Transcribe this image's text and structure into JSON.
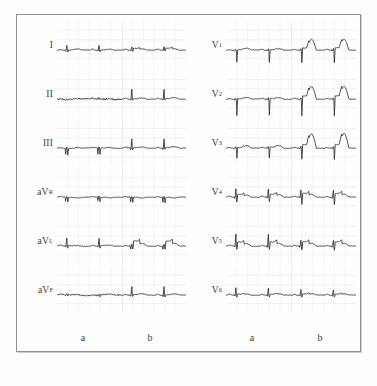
{
  "figure": {
    "kind": "ecg-12-lead-comparison",
    "top_remnant_text": "· · · · · ·",
    "border_color": "#8e8e93",
    "trace_color": "#2f2f33",
    "grid_color": "#e3dcd8",
    "background_color": "#fefefe"
  },
  "columns": [
    {
      "key": "left-a",
      "label": "a"
    },
    {
      "key": "left-b",
      "label": "b"
    },
    {
      "key": "right-a",
      "label": "a"
    },
    {
      "key": "right-b",
      "label": "b"
    }
  ],
  "left_leads": [
    {
      "name": "I",
      "base": "I",
      "sub": ""
    },
    {
      "name": "II",
      "base": "II",
      "sub": ""
    },
    {
      "name": "III",
      "base": "III",
      "sub": ""
    },
    {
      "name": "aVR",
      "base": "aV",
      "sub": "R"
    },
    {
      "name": "aVL",
      "base": "aV",
      "sub": "L"
    },
    {
      "name": "aVF",
      "base": "aV",
      "sub": "F"
    }
  ],
  "right_leads": [
    {
      "name": "V1",
      "base": "V",
      "sub": "1"
    },
    {
      "name": "V2",
      "base": "V",
      "sub": "2"
    },
    {
      "name": "V3",
      "base": "V",
      "sub": "3"
    },
    {
      "name": "V4",
      "base": "V",
      "sub": "4"
    },
    {
      "name": "V5",
      "base": "V",
      "sub": "5"
    },
    {
      "name": "V6",
      "base": "V",
      "sub": "6"
    }
  ],
  "chart_data": {
    "type": "line",
    "title": "",
    "xlabel": "",
    "ylabel": "",
    "beats_per_cell": 2,
    "baseline_mm": 0,
    "series": [
      {
        "lead": "I",
        "state": "a",
        "features": {
          "r_mm": 4.5,
          "q_mm": -1.0,
          "s_mm": -1.2,
          "t_mm": 0.6,
          "st_mm": 0.2,
          "baseline_noise": 0.35
        }
      },
      {
        "lead": "I",
        "state": "b",
        "features": {
          "r_mm": 3.2,
          "q_mm": -0.6,
          "s_mm": -0.8,
          "t_mm": 0.5,
          "st_mm": 1.2,
          "baseline_noise": 0.25
        }
      },
      {
        "lead": "II",
        "state": "a",
        "features": {
          "r_mm": 1.2,
          "q_mm": -0.4,
          "s_mm": -0.6,
          "t_mm": 0.4,
          "st_mm": 0.1,
          "baseline_noise": 0.9
        }
      },
      {
        "lead": "II",
        "state": "b",
        "features": {
          "r_mm": 9.0,
          "q_mm": -0.8,
          "s_mm": -1.0,
          "t_mm": 0.8,
          "st_mm": 0.3,
          "baseline_noise": 0.3
        }
      },
      {
        "lead": "III",
        "state": "a",
        "features": {
          "r_mm": 1.0,
          "q_mm": -5.5,
          "s_mm": -5.0,
          "t_mm": 0.5,
          "st_mm": 0.0,
          "baseline_noise": 0.5
        }
      },
      {
        "lead": "III",
        "state": "b",
        "features": {
          "r_mm": 8.5,
          "q_mm": -1.5,
          "s_mm": -1.2,
          "t_mm": 0.7,
          "st_mm": 0.3,
          "baseline_noise": 0.3
        }
      },
      {
        "lead": "aVR",
        "state": "a",
        "features": {
          "r_mm": 0.8,
          "q_mm": -3.5,
          "s_mm": -3.8,
          "t_mm": -0.4,
          "st_mm": -0.1,
          "baseline_noise": 0.4
        }
      },
      {
        "lead": "aVR",
        "state": "b",
        "features": {
          "r_mm": 0.6,
          "q_mm": -4.5,
          "s_mm": -4.2,
          "t_mm": -0.5,
          "st_mm": -0.2,
          "baseline_noise": 0.3
        }
      },
      {
        "lead": "aVL",
        "state": "a",
        "features": {
          "r_mm": 7.0,
          "q_mm": -1.0,
          "s_mm": -1.4,
          "t_mm": 0.4,
          "st_mm": 0.2,
          "baseline_noise": 0.4
        }
      },
      {
        "lead": "aVL",
        "state": "b",
        "features": {
          "r_mm": 2.0,
          "q_mm": -2.6,
          "s_mm": -2.2,
          "t_mm": 0.6,
          "st_mm": 3.2,
          "baseline_noise": 0.3
        }
      },
      {
        "lead": "aVF",
        "state": "a",
        "features": {
          "r_mm": 1.1,
          "q_mm": -0.8,
          "s_mm": -1.0,
          "t_mm": 0.4,
          "st_mm": 0.1,
          "baseline_noise": 0.8
        }
      },
      {
        "lead": "aVF",
        "state": "b",
        "features": {
          "r_mm": 8.0,
          "q_mm": -1.0,
          "s_mm": -1.2,
          "t_mm": 0.7,
          "st_mm": 0.3,
          "baseline_noise": 0.3
        }
      },
      {
        "lead": "V1",
        "state": "a",
        "features": {
          "r_mm": 1.0,
          "q_mm": -0.6,
          "s_mm": -9.0,
          "t_mm": 1.0,
          "st_mm": 0.4,
          "baseline_noise": 0.4
        }
      },
      {
        "lead": "V1",
        "state": "b",
        "features": {
          "r_mm": 1.2,
          "q_mm": -0.8,
          "s_mm": -9.5,
          "t_mm": 6.5,
          "st_mm": 1.5,
          "baseline_noise": 0.3
        }
      },
      {
        "lead": "V2",
        "state": "a",
        "features": {
          "r_mm": 0.8,
          "q_mm": -0.5,
          "s_mm": -12.0,
          "t_mm": 1.0,
          "st_mm": 0.4,
          "baseline_noise": 0.4
        }
      },
      {
        "lead": "V2",
        "state": "b",
        "features": {
          "r_mm": 1.0,
          "q_mm": -0.6,
          "s_mm": -12.5,
          "t_mm": 7.5,
          "st_mm": 2.0,
          "baseline_noise": 0.3
        }
      },
      {
        "lead": "V3",
        "state": "a",
        "features": {
          "r_mm": 1.5,
          "q_mm": -0.6,
          "s_mm": -7.5,
          "t_mm": 1.6,
          "st_mm": 0.5,
          "baseline_noise": 0.4
        }
      },
      {
        "lead": "V3",
        "state": "b",
        "features": {
          "r_mm": 1.4,
          "q_mm": -0.8,
          "s_mm": -8.5,
          "t_mm": 8.5,
          "st_mm": 2.2,
          "baseline_noise": 0.3
        }
      },
      {
        "lead": "V4",
        "state": "a",
        "features": {
          "r_mm": 7.5,
          "q_mm": -1.0,
          "s_mm": -3.5,
          "t_mm": 0.9,
          "st_mm": 1.8,
          "baseline_noise": 0.35
        }
      },
      {
        "lead": "V4",
        "state": "b",
        "features": {
          "r_mm": 6.5,
          "q_mm": -1.0,
          "s_mm": -5.5,
          "t_mm": 1.0,
          "st_mm": 2.4,
          "baseline_noise": 0.3
        }
      },
      {
        "lead": "V5",
        "state": "a",
        "features": {
          "r_mm": 11.0,
          "q_mm": -1.0,
          "s_mm": -2.5,
          "t_mm": 0.8,
          "st_mm": 2.6,
          "baseline_noise": 0.35
        }
      },
      {
        "lead": "V5",
        "state": "b",
        "features": {
          "r_mm": 5.5,
          "q_mm": -1.0,
          "s_mm": -3.0,
          "t_mm": 0.8,
          "st_mm": 2.8,
          "baseline_noise": 0.3
        }
      },
      {
        "lead": "V6",
        "state": "a",
        "features": {
          "r_mm": 6.5,
          "q_mm": -0.8,
          "s_mm": -1.5,
          "t_mm": 0.6,
          "st_mm": 0.6,
          "baseline_noise": 0.3
        }
      },
      {
        "lead": "V6",
        "state": "b",
        "features": {
          "r_mm": 5.0,
          "q_mm": -0.8,
          "s_mm": -1.4,
          "t_mm": 0.6,
          "st_mm": 0.8,
          "baseline_noise": 0.3
        }
      }
    ]
  }
}
